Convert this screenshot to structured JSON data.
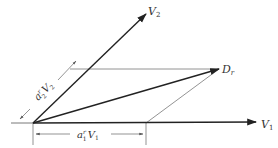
{
  "diagram": {
    "type": "vector-parallelogram",
    "vectors": [
      {
        "id": "V1",
        "label": "V",
        "subscript": "1",
        "from": [
          33,
          123
        ],
        "to": [
          256,
          122
        ]
      },
      {
        "id": "V2",
        "label": "V",
        "subscript": "2",
        "from": [
          33,
          123
        ],
        "to": [
          146,
          14
        ]
      },
      {
        "id": "Dr",
        "label": "D",
        "subscript": "r",
        "from": [
          33,
          123
        ],
        "to": [
          219,
          69
        ]
      }
    ],
    "labels": {
      "v1": {
        "main": "V",
        "sub": "1"
      },
      "v2": {
        "main": "V",
        "sub": "2"
      },
      "dr": {
        "main": "D",
        "sub": "r"
      },
      "a1v1": {
        "a": "a",
        "sup": "r",
        "sub": "1",
        "v": "V",
        "vsub": "1"
      },
      "a2v2": {
        "a": "a",
        "sup": "r",
        "sub": "2",
        "v": "V",
        "vsub": "2"
      }
    },
    "colors": {
      "vector": "#222222",
      "construction": "#777777",
      "text": "#333333"
    }
  }
}
